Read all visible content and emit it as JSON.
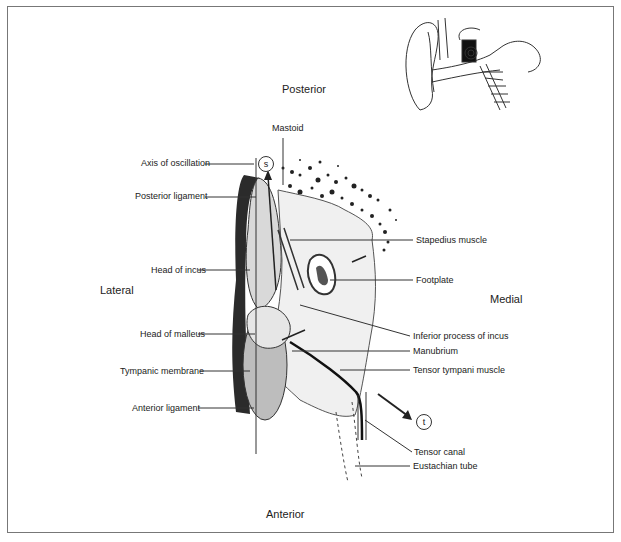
{
  "directions": {
    "top": "Posterior",
    "bottom": "Anterior",
    "left": "Lateral",
    "right": "Medial"
  },
  "markers": {
    "s": "s",
    "t": "t"
  },
  "labels_left": [
    "Axis of oscillation",
    "Posterior ligament",
    "Head of incus",
    "Head of malleus",
    "Tympanic membrane",
    "Anterior ligament"
  ],
  "labels_top": [
    "Mastoid"
  ],
  "labels_right": [
    "Stapedius muscle",
    "Footplate",
    "Inferior process of incus",
    "Manubrium",
    "Tensor tympani muscle",
    "Tensor canal",
    "Eustachian tube"
  ],
  "inset": "ear-cross-section-icon"
}
